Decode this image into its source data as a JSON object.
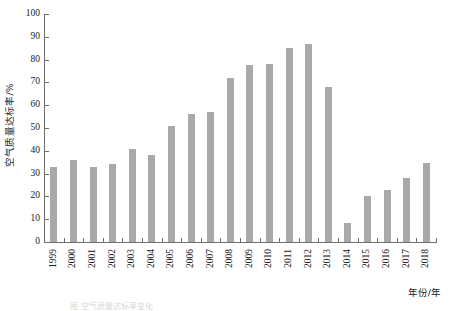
{
  "chart_data": {
    "type": "bar",
    "title": "",
    "xlabel": "年份/年",
    "ylabel": "空气质量达标率/%",
    "categories": [
      "1999",
      "2000",
      "2001",
      "2002",
      "2003",
      "2004",
      "2005",
      "2006",
      "2007",
      "2008",
      "2009",
      "2010",
      "2011",
      "2012",
      "2013",
      "2014",
      "2015",
      "2016",
      "2017",
      "2018"
    ],
    "values": [
      33,
      36,
      33,
      34,
      41,
      38,
      51,
      56,
      57,
      72,
      77.5,
      78,
      85,
      87,
      68,
      8.5,
      20,
      23,
      28,
      34.5
    ],
    "ylim": [
      0,
      100
    ],
    "ytick_labels": [
      "0",
      "10",
      "20",
      "30",
      "40",
      "50",
      "60",
      "70",
      "80",
      "90",
      "100"
    ],
    "ytick_values": [
      0,
      10,
      20,
      30,
      40,
      50,
      60,
      70,
      80,
      90,
      100
    ],
    "grid": false,
    "legend": null,
    "series_name": "空气质量达标率",
    "bar_color": "#a9a9a9",
    "axis_color": "#6e6e6e"
  },
  "figure": {
    "caption": "图   空气质量达标率变化"
  }
}
